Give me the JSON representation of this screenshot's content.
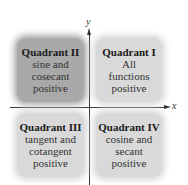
{
  "axes": {
    "x_label": "x",
    "y_label": "y"
  },
  "quadrants": [
    {
      "id": "II",
      "title": "Quadrant II",
      "lines": [
        "sine and",
        "cosecant",
        "positive"
      ],
      "fill": "#a9a9a9"
    },
    {
      "id": "I",
      "title": "Quadrant I",
      "lines": [
        "All",
        "functions",
        "positive"
      ],
      "fill": "#d9d9d9"
    },
    {
      "id": "III",
      "title": "Quadrant III",
      "lines": [
        "tangent and",
        "cotangent",
        "positive"
      ],
      "fill": "#d9d9d9"
    },
    {
      "id": "IV",
      "title": "Quadrant IV",
      "lines": [
        "cosine and",
        "secant",
        "positive"
      ],
      "fill": "#d9d9d9"
    }
  ]
}
